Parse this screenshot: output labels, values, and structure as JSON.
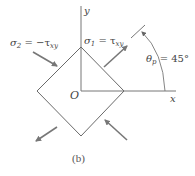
{
  "figure": {
    "caption": "(b)",
    "axes": {
      "x_label": "x",
      "y_label": "y",
      "origin_label": "O"
    },
    "stress_labels": {
      "sigma2": {
        "symbol": "σ",
        "sub": "2",
        "eq": " = −τ",
        "eq_sub": "xy"
      },
      "sigma1": {
        "symbol": "σ",
        "sub": "1",
        "eq": " = τ",
        "eq_sub": "xy"
      }
    },
    "angle_label": {
      "symbol": "θ",
      "sub": "p",
      "eq": " = 45°"
    },
    "colors": {
      "line": "#6a6a6a",
      "arrow": "#777777",
      "text": "#444444"
    }
  }
}
